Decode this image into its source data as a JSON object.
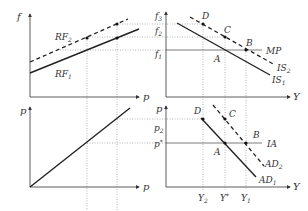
{
  "panels": {
    "top_left": {
      "y_axis_label": "f",
      "x_axis_label": "p",
      "curves": [
        {
          "name": "RF",
          "sub": "2",
          "style": "dashed"
        },
        {
          "name": "RF",
          "sub": "1",
          "style": "solid"
        }
      ]
    },
    "top_right": {
      "y_axis_label": "f",
      "x_axis_label": "Y",
      "tick_labels": [
        {
          "name": "f",
          "sub": "3"
        },
        {
          "name": "f",
          "sub": "2"
        },
        {
          "name": "f",
          "sub": "1"
        }
      ],
      "points": [
        "D",
        "C",
        "B",
        "A"
      ],
      "curves": [
        {
          "name": "MP",
          "sub": ""
        },
        {
          "name": "IS",
          "sub": "2",
          "style": "dashed"
        },
        {
          "name": "IS",
          "sub": "1",
          "style": "solid"
        }
      ]
    },
    "bottom_left": {
      "y_axis_label": "p",
      "x_axis_label": "p"
    },
    "bottom_right": {
      "y_axis_label": "p",
      "x_axis_label": "Y",
      "tick_labels": [
        {
          "name": "p",
          "sub": "2"
        },
        {
          "name": "p",
          "sup": "*"
        }
      ],
      "x_tick_labels": [
        {
          "name": "Y",
          "sub": "2"
        },
        {
          "name": "Y",
          "sup": "*"
        },
        {
          "name": "Y",
          "sub": "1"
        }
      ],
      "points": [
        "D",
        "C",
        "B",
        "A"
      ],
      "curves": [
        {
          "name": "IA",
          "sub": ""
        },
        {
          "name": "AD",
          "sub": "2",
          "style": "dashed"
        },
        {
          "name": "AD",
          "sub": "1",
          "style": "solid"
        }
      ]
    }
  }
}
